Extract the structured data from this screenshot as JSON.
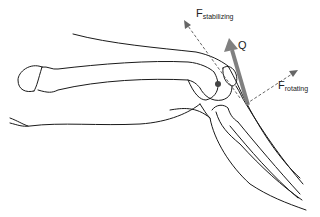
{
  "diagram": {
    "labels": {
      "f_stabilizing": {
        "main": "F",
        "sub": "stabilizing"
      },
      "q": "Q",
      "f_rotating": {
        "main": "F",
        "sub": "rotating"
      }
    },
    "colors": {
      "outline": "#1a1a1a",
      "q_arrow": "#808080",
      "force_dashed": "#666666",
      "background": "#ffffff"
    }
  }
}
